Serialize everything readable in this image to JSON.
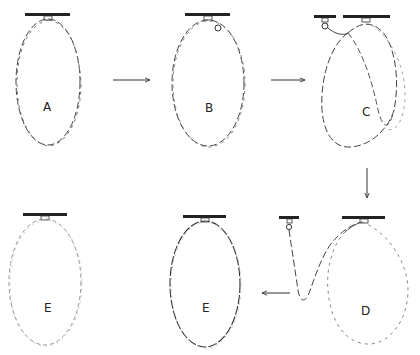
{
  "diagram": {
    "panels": [
      {
        "id": "A",
        "label": "A"
      },
      {
        "id": "B",
        "label": "B"
      },
      {
        "id": "C",
        "label": "C"
      },
      {
        "id": "D",
        "label": "D"
      },
      {
        "id": "E1",
        "label": "E"
      },
      {
        "id": "E2",
        "label": "E"
      }
    ],
    "arrows": [
      {
        "from": "A",
        "to": "B",
        "direction": "right"
      },
      {
        "from": "B",
        "to": "C",
        "direction": "right"
      },
      {
        "from": "C",
        "to": "D",
        "direction": "down"
      },
      {
        "from": "D",
        "to": "E",
        "direction": "left"
      }
    ],
    "colors": {
      "strand_dark": "#333333",
      "strand_light": "#9a9a9a",
      "bar": "#222222"
    }
  }
}
